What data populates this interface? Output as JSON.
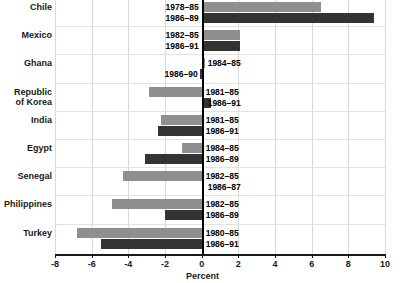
{
  "chart_data": {
    "type": "bar",
    "orientation": "horizontal",
    "title": "",
    "xlabel": "Percent",
    "ylabel": "",
    "xlim": [
      -8,
      10
    ],
    "xticks": [
      -8,
      -6,
      -4,
      -2,
      0,
      2,
      4,
      6,
      8,
      10
    ],
    "xtick_labels": [
      "-8",
      "-6",
      "-4",
      "-2",
      "0",
      "2",
      "4",
      "6",
      "8",
      "10"
    ],
    "grid": true,
    "grid_axis": "x",
    "legend": "none",
    "series": [
      {
        "name": "earlier period",
        "color": "#8f8f8f"
      },
      {
        "name": "later period",
        "color": "#333333"
      }
    ],
    "categories": [
      "Chile",
      "Mexico",
      "Ghana",
      "Republic of Korea",
      "India",
      "Egypt",
      "Senegal",
      "Philippines",
      "Turkey"
    ],
    "points": [
      {
        "category": "Chile",
        "label_a": "1978–85",
        "value_a": 6.5,
        "label_b": "1986–89",
        "value_b": 9.4
      },
      {
        "category": "Mexico",
        "label_a": "1982–85",
        "value_a": 2.1,
        "label_b": "1986–91",
        "value_b": 2.1
      },
      {
        "category": "Ghana",
        "label_a": "1984–85",
        "value_a": 0.2,
        "label_b": "1986–90",
        "value_b": -0.1
      },
      {
        "category": "Republic of Korea",
        "label_a": "1981–85",
        "value_a": -2.9,
        "label_b": "1986–91",
        "value_b": 0.5
      },
      {
        "category": "India",
        "label_a": "1981–85",
        "value_a": -2.2,
        "label_b": "1986–91",
        "value_b": -2.4
      },
      {
        "category": "Egypt",
        "label_a": "1984–85",
        "value_a": -1.1,
        "label_b": "1986–89",
        "value_b": -3.1
      },
      {
        "category": "Senegal",
        "label_a": "1982–85",
        "value_a": -4.3,
        "label_b": "1986–87",
        "value_b": 0.0
      },
      {
        "category": "Philippines",
        "label_a": "1982–85",
        "value_a": -4.9,
        "label_b": "1986–89",
        "value_b": -2.0
      },
      {
        "category": "Turkey",
        "label_a": "1980–85",
        "value_a": -6.8,
        "label_b": "1986–91",
        "value_b": -5.5
      }
    ]
  }
}
